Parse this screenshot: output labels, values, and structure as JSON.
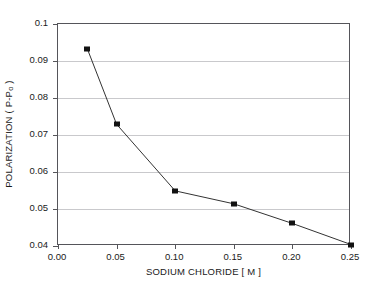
{
  "chart_data": {
    "type": "line",
    "title": "",
    "xlabel": "SODIUM CHLORIDE [ M ]",
    "ylabel_prefix": "POLARIZATION ( P-P",
    "ylabel_subscript": "o",
    "ylabel_suffix": " )",
    "ylabel_full": "POLARIZATION ( P-Po )",
    "x": [
      0.025,
      0.05,
      0.1,
      0.15,
      0.2,
      0.25
    ],
    "values": [
      0.0933,
      0.0729,
      0.0549,
      0.0514,
      0.0461,
      0.0404
    ],
    "series": [
      {
        "name": "polarization",
        "x": [
          0.025,
          0.05,
          0.1,
          0.15,
          0.2,
          0.25
        ],
        "values": [
          0.0933,
          0.0729,
          0.0549,
          0.0514,
          0.0461,
          0.0404
        ],
        "marker": "square",
        "marker_color": "#121212",
        "line_color": "#333333"
      }
    ],
    "xlim": [
      0.0,
      0.25
    ],
    "ylim": [
      0.04,
      0.1
    ],
    "xticks": [
      0.0,
      0.05,
      0.1,
      0.15,
      0.2,
      0.25
    ],
    "xtick_labels": [
      "0.00",
      "0.05",
      "0.10",
      "0.15",
      "0.20",
      "0.25"
    ],
    "yticks": [
      0.04,
      0.05,
      0.06,
      0.07,
      0.08,
      0.09,
      0.1
    ],
    "ytick_labels": [
      "0.04",
      "0.05",
      "0.06",
      "0.07",
      "0.08",
      "0.09",
      "0.1"
    ],
    "grid": "horizontal",
    "grid_color": "#c9c9cc",
    "legend": null,
    "legend_position": "none",
    "axis_color": "#55555a",
    "background": "#ffffff"
  }
}
